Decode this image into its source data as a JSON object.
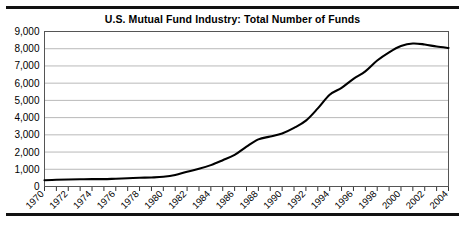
{
  "chart_data": {
    "type": "line",
    "title": "U.S. Mutual Fund Industry: Total Number of Funds",
    "xlabel": "",
    "ylabel": "",
    "ylim": [
      0,
      9000
    ],
    "xlim": [
      1970,
      2004
    ],
    "grid": true,
    "legend": false,
    "y_ticks": [
      0,
      1000,
      2000,
      3000,
      4000,
      5000,
      6000,
      7000,
      8000,
      9000
    ],
    "y_tick_labels": [
      "0",
      "1,000",
      "2,000",
      "3,000",
      "4,000",
      "5,000",
      "6,000",
      "7,000",
      "8,000",
      "9,000"
    ],
    "x_ticks": [
      1970,
      1972,
      1974,
      1976,
      1978,
      1980,
      1982,
      1984,
      1986,
      1988,
      1990,
      1992,
      1994,
      1996,
      1998,
      2000,
      2002,
      2004
    ],
    "x_tick_labels": [
      "1970",
      "1972",
      "1974",
      "1976",
      "1978",
      "1980",
      "1982",
      "1984",
      "1986",
      "1988",
      "1990",
      "1992",
      "1994",
      "1996",
      "1998",
      "2000",
      "2002",
      "2004"
    ],
    "series": [
      {
        "name": "Total Number of Funds",
        "color": "#000000",
        "x": [
          1970,
          1971,
          1972,
          1973,
          1974,
          1975,
          1976,
          1977,
          1978,
          1979,
          1980,
          1981,
          1982,
          1983,
          1984,
          1985,
          1986,
          1987,
          1988,
          1989,
          1990,
          1991,
          1992,
          1993,
          1994,
          1995,
          1996,
          1997,
          1998,
          1999,
          2000,
          2001,
          2002,
          2003,
          2004
        ],
        "values": [
          361,
          392,
          410,
          421,
          431,
          426,
          452,
          477,
          505,
          526,
          564,
          665,
          857,
          1026,
          1241,
          1528,
          1835,
          2312,
          2737,
          2900,
          3079,
          3403,
          3824,
          4534,
          5325,
          5725,
          6248,
          6684,
          7314,
          7791,
          8155,
          8305,
          8244,
          8126,
          8044
        ]
      }
    ],
    "peak": {
      "year": 2001,
      "value": 8305
    },
    "annotations": []
  }
}
